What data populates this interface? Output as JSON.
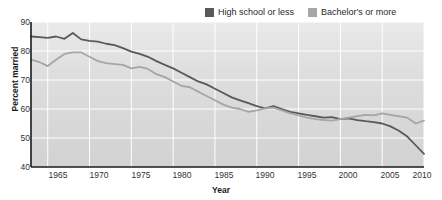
{
  "chart_data": {
    "type": "line",
    "title": "",
    "xlabel": "Year",
    "ylabel": "Percent married",
    "xlim": [
      1963,
      2010
    ],
    "ylim": [
      40,
      90
    ],
    "yticks": [
      90,
      80,
      70,
      60,
      50,
      40
    ],
    "xticks": [
      1965,
      1970,
      1975,
      1980,
      1985,
      1990,
      1995,
      2000,
      2005,
      2010
    ],
    "grid": true,
    "legend_position": "top-right",
    "colors": {
      "high_school_or_less": "#595959",
      "bachelors_or_more": "#a6a6a6",
      "plot_background": "#dcdcdc",
      "gridline": "#ffffff",
      "axis": "#1a1a1a"
    },
    "x": [
      1963,
      1964,
      1965,
      1966,
      1967,
      1968,
      1969,
      1970,
      1971,
      1972,
      1973,
      1974,
      1975,
      1976,
      1977,
      1978,
      1979,
      1980,
      1981,
      1982,
      1983,
      1984,
      1985,
      1986,
      1987,
      1988,
      1989,
      1990,
      1991,
      1992,
      1993,
      1994,
      1995,
      1996,
      1997,
      1998,
      1999,
      2000,
      2001,
      2002,
      2003,
      2004,
      2005,
      2006,
      2007,
      2008,
      2009,
      2010
    ],
    "series": [
      {
        "name": "High school or less",
        "color": "#595959",
        "values": [
          85.0,
          84.8,
          84.5,
          85.0,
          84.2,
          86.2,
          84.0,
          83.5,
          83.2,
          82.5,
          82.0,
          81.0,
          79.8,
          79.0,
          78.0,
          76.5,
          75.2,
          74.0,
          72.5,
          71.0,
          69.5,
          68.5,
          67.0,
          65.5,
          64.0,
          63.0,
          62.0,
          61.0,
          60.2,
          61.0,
          60.0,
          59.0,
          58.5,
          58.0,
          57.5,
          57.0,
          57.2,
          56.5,
          56.8,
          56.2,
          55.8,
          55.5,
          55.0,
          54.0,
          52.5,
          50.5,
          47.5,
          44.5
        ]
      },
      {
        "name": "Bachelor's or more",
        "color": "#a6a6a6",
        "values": [
          77.0,
          76.2,
          74.8,
          77.0,
          79.0,
          79.5,
          79.5,
          78.0,
          76.5,
          75.8,
          75.5,
          75.2,
          74.0,
          74.5,
          73.8,
          72.0,
          71.0,
          69.5,
          68.0,
          67.5,
          66.0,
          64.5,
          63.0,
          61.5,
          60.5,
          60.0,
          59.0,
          59.5,
          60.2,
          60.5,
          59.5,
          58.5,
          57.8,
          57.0,
          56.5,
          56.2,
          56.0,
          56.5,
          57.0,
          57.5,
          58.0,
          57.8,
          58.5,
          58.0,
          57.5,
          57.0,
          55.0,
          56.0
        ]
      }
    ]
  },
  "legend": {
    "items": [
      {
        "label": "High school or less",
        "color": "#595959"
      },
      {
        "label": "Bachelor's or more",
        "color": "#a6a6a6"
      }
    ]
  },
  "axes": {
    "ylabel": "Percent married",
    "xlabel": "Year",
    "yticks": [
      "90",
      "80",
      "70",
      "60",
      "50",
      "40"
    ],
    "xticks": [
      "1965",
      "1970",
      "1975",
      "1980",
      "1985",
      "1990",
      "1995",
      "2000",
      "2005",
      "2010"
    ]
  }
}
